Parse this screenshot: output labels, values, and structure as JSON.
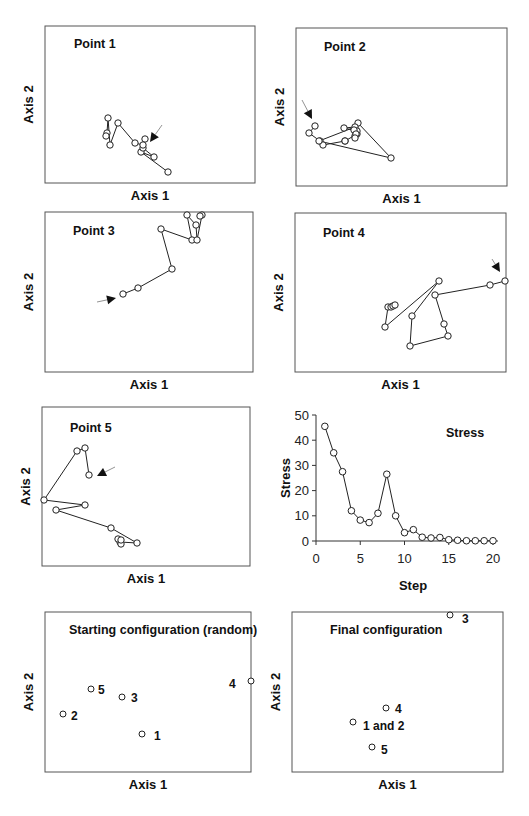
{
  "colors": {
    "line": "#222222",
    "frame": "#555555",
    "background": "#ffffff"
  },
  "panels": [
    {
      "id": "p1",
      "title": "Point 1",
      "xlabel": "Axis 1",
      "ylabel": "Axis 2",
      "frame": [
        45,
        26,
        255,
        183
      ],
      "title_pos": [
        74,
        48
      ],
      "path": [
        [
          168,
          172
        ],
        [
          141,
          152
        ],
        [
          154,
          157
        ],
        [
          143,
          148
        ],
        [
          145,
          139
        ],
        [
          143,
          145
        ],
        [
          135,
          143
        ],
        [
          118,
          123
        ],
        [
          110,
          145
        ],
        [
          108,
          118
        ],
        [
          107,
          133
        ],
        [
          106,
          136
        ]
      ],
      "arrow": {
        "tip": [
          150,
          142
        ],
        "from": [
          162,
          125
        ]
      }
    },
    {
      "id": "p2",
      "title": "Point 2",
      "xlabel": "Axis 1",
      "ylabel": "Axis 2",
      "frame": [
        296,
        28,
        507,
        186
      ],
      "title_pos": [
        324,
        51
      ],
      "path": [
        [
          315,
          126
        ],
        [
          309,
          133
        ],
        [
          320,
          141
        ],
        [
          323,
          145
        ],
        [
          345,
          141
        ],
        [
          345,
          141
        ],
        [
          357,
          134
        ],
        [
          358,
          123
        ],
        [
          391,
          158
        ],
        [
          319,
          141
        ],
        [
          355,
          127
        ],
        [
          344,
          128
        ],
        [
          357,
          131
        ],
        [
          355,
          136
        ],
        [
          354,
          130
        ],
        [
          356,
          134
        ],
        [
          355,
          138
        ]
      ],
      "arrow": {
        "tip": [
          312,
          119
        ],
        "from": [
          302,
          100
        ]
      }
    },
    {
      "id": "p3",
      "title": "Point 3",
      "xlabel": "Axis 1",
      "ylabel": "Axis 2",
      "frame": [
        45,
        212,
        253,
        372
      ],
      "title_pos": [
        73,
        235
      ],
      "path": [
        [
          123,
          294
        ],
        [
          138,
          288
        ],
        [
          172,
          269
        ],
        [
          161,
          229
        ],
        [
          192,
          240
        ],
        [
          187,
          215
        ],
        [
          196,
          225
        ],
        [
          197,
          240
        ],
        [
          202,
          215
        ],
        [
          200,
          216
        ]
      ],
      "arrow": {
        "tip": [
          116,
          298
        ],
        "from": [
          97,
          302
        ]
      }
    },
    {
      "id": "p4",
      "title": "Point 4",
      "xlabel": "Axis 1",
      "ylabel": "Axis 2",
      "frame": [
        295,
        213,
        506,
        372
      ],
      "title_pos": [
        323,
        237
      ],
      "path": [
        [
          505,
          281
        ],
        [
          490,
          285
        ],
        [
          435,
          295
        ],
        [
          444,
          324
        ],
        [
          448,
          336
        ],
        [
          410,
          346
        ],
        [
          412,
          316
        ],
        [
          439,
          281
        ],
        [
          385,
          327
        ],
        [
          388,
          307
        ],
        [
          391,
          307
        ],
        [
          393,
          306
        ],
        [
          395,
          305
        ]
      ],
      "arrow": {
        "tip": [
          500,
          272
        ],
        "from": [
          492,
          259
        ]
      }
    },
    {
      "id": "p5",
      "title": "Point 5",
      "xlabel": "Axis 1",
      "ylabel": "Axis 2",
      "frame": [
        42,
        407,
        250,
        566
      ],
      "title_pos": [
        70,
        432
      ],
      "path": [
        [
          89,
          475
        ],
        [
          85,
          448
        ],
        [
          77,
          451
        ],
        [
          44,
          500
        ],
        [
          85,
          505
        ],
        [
          56,
          510
        ],
        [
          111,
          528
        ],
        [
          137,
          543
        ],
        [
          120,
          542
        ],
        [
          121,
          544
        ],
        [
          118,
          539
        ],
        [
          121,
          540
        ]
      ],
      "arrow": {
        "tip": [
          97,
          476
        ],
        "from": [
          115,
          467
        ]
      }
    }
  ],
  "chart_data": [
    {
      "type": "line",
      "title": "Stress",
      "xlabel": "Step",
      "ylabel": "Stress",
      "xlim": [
        0,
        20
      ],
      "ylim": [
        0,
        50
      ],
      "xticks": [
        0,
        5,
        10,
        15,
        20
      ],
      "yticks": [
        0,
        10,
        20,
        30,
        40,
        50
      ],
      "grid": false,
      "x": [
        1,
        2,
        3,
        4,
        5,
        6,
        7,
        8,
        9,
        10,
        11,
        12,
        13,
        14,
        15,
        16,
        17,
        18,
        19,
        20
      ],
      "values": [
        45.5,
        35,
        27.5,
        12,
        8.3,
        7.3,
        11,
        26.5,
        10,
        3.3,
        4.5,
        1.5,
        1.2,
        1.4,
        0.5,
        0.3,
        0.1,
        0.1,
        0.1,
        0.1
      ]
    },
    {
      "type": "scatter",
      "title": "Starting configuration (random)",
      "xlabel": "Axis 1",
      "ylabel": "Axis 2",
      "points": [
        {
          "label": "1",
          "x": 0.47,
          "y": 0.24
        },
        {
          "label": "2",
          "x": 0.09,
          "y": 0.36
        },
        {
          "label": "3",
          "x": 0.38,
          "y": 0.47
        },
        {
          "label": "4",
          "x": 1.0,
          "y": 0.57
        },
        {
          "label": "5",
          "x": 0.23,
          "y": 0.52
        }
      ]
    },
    {
      "type": "scatter",
      "title": "Final configuration",
      "xlabel": "Axis 1",
      "ylabel": "Axis 2",
      "points": [
        {
          "label": "1 and 2",
          "x": 0.29,
          "y": 0.3
        },
        {
          "label": "3",
          "x": 0.75,
          "y": 1.0
        },
        {
          "label": "4",
          "x": 0.45,
          "y": 0.4
        },
        {
          "label": "5",
          "x": 0.38,
          "y": 0.15
        }
      ]
    }
  ],
  "stress_panel": {
    "title": "Stress",
    "xlabel": "Step",
    "ylabel": "Stress",
    "origin": [
      316,
      541
    ],
    "xscale": 8.85,
    "yscale": 2.52
  },
  "start_panel": {
    "title": "Starting configuration (random)",
    "xlabel": "Axis 1",
    "ylabel": "Axis 2",
    "frame": [
      45,
      612,
      251,
      772
    ],
    "points": [
      {
        "label": "1",
        "px": [
          142,
          734
        ],
        "lx": [
          154,
          740
        ]
      },
      {
        "label": "2",
        "px": [
          63,
          714
        ],
        "lx": [
          71,
          720
        ]
      },
      {
        "label": "3",
        "px": [
          122,
          697
        ],
        "lx": [
          131,
          702
        ]
      },
      {
        "label": "4",
        "px": [
          251,
          681
        ],
        "lx": [
          229,
          688
        ]
      },
      {
        "label": "5",
        "px": [
          91,
          689
        ],
        "lx": [
          98,
          694
        ]
      }
    ]
  },
  "final_panel": {
    "title": "Final configuration",
    "xlabel": "Axis 1",
    "ylabel": "Axis 2",
    "frame": [
      292,
      612,
      503,
      772
    ],
    "points": [
      {
        "label": "3",
        "px": [
          450,
          615
        ],
        "lx": [
          462,
          623
        ]
      },
      {
        "label": "4",
        "px": [
          386,
          708
        ],
        "lx": [
          395,
          713
        ]
      },
      {
        "label": "1 and 2",
        "px": [
          353,
          722
        ],
        "lx": [
          363,
          730
        ]
      },
      {
        "label": "5",
        "px": [
          372,
          747
        ],
        "lx": [
          381,
          754
        ]
      }
    ]
  }
}
